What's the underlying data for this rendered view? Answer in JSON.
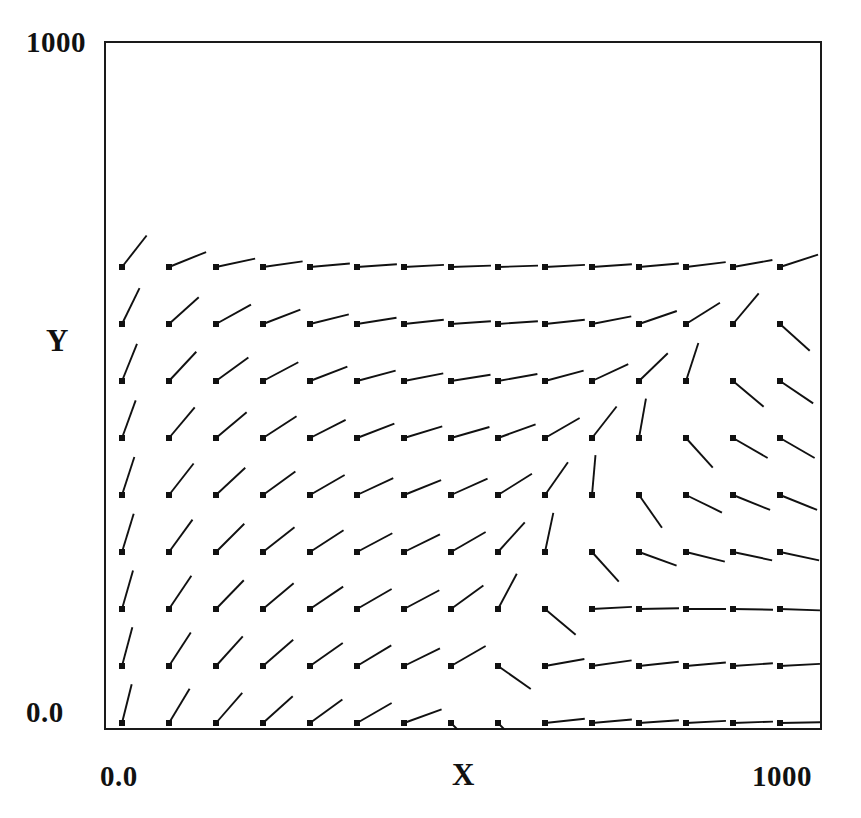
{
  "figure": {
    "kind": "vector-field-plot",
    "background_color": "#ffffff",
    "frame_color": "#1a1a1a",
    "vector_color": "#111111",
    "marker_color": "#111111"
  },
  "axes": {
    "x": {
      "title": "X",
      "tick_labels": [
        "0.0",
        "1000"
      ],
      "range": [
        0,
        1000
      ]
    },
    "y": {
      "title": "Y",
      "tick_labels": [
        "0.0",
        "1000"
      ],
      "range": [
        0,
        1000
      ]
    }
  },
  "chart_data": {
    "type": "scatter",
    "subtype": "quiver",
    "title": "",
    "xlabel": "X",
    "ylabel": "Y",
    "xlim": [
      0,
      1000
    ],
    "ylim": [
      0,
      1000
    ],
    "xticks": [
      0,
      1000
    ],
    "xticklabels": [
      "0.0",
      "1000"
    ],
    "yticks": [
      0,
      1000
    ],
    "yticklabels": [
      "0.0",
      "1000"
    ],
    "grid": false,
    "legend": null,
    "grid_shape": {
      "columns": 16,
      "rows": 14
    },
    "marker": "filled-square",
    "marker_size_px": 6,
    "vector_length_px": 40,
    "annotations": [
      {
        "label": "saddle/convergence point",
        "x": 660,
        "y": 660
      },
      {
        "label": "source point",
        "x": 862,
        "y": 295
      }
    ],
    "x_grid": [
      18,
      65,
      112,
      159,
      206,
      253,
      300,
      347,
      394,
      441,
      488,
      535,
      582,
      629,
      676,
      723
    ],
    "y_grid": [
      967,
      910,
      853,
      796,
      739,
      682,
      625,
      568,
      511,
      454,
      397,
      340,
      283,
      226
    ],
    "vectors": [
      {
        "row": 0,
        "angles_deg": [
          50,
          -23,
          -47,
          -58,
          -64,
          -70,
          -77,
          -84,
          -86,
          -82,
          -76,
          -68,
          -60,
          -52,
          -47,
          -40
        ]
      },
      {
        "row": 1,
        "angles_deg": [
          80,
          47,
          7,
          -8,
          -38,
          -54,
          -62,
          -66,
          -66,
          -62,
          -55,
          -47,
          -40,
          -34,
          -30,
          -27
        ]
      },
      {
        "row": 2,
        "angles_deg": [
          80,
          62,
          38,
          25,
          8,
          -12,
          -30,
          -45,
          -50,
          -48,
          -42,
          -36,
          -31,
          -27,
          -24,
          -21
        ]
      },
      {
        "row": 3,
        "angles_deg": [
          78,
          62,
          48,
          38,
          28,
          14,
          -5,
          -32,
          -50,
          -44,
          -34,
          -28,
          -24,
          -21,
          -19,
          -17
        ]
      },
      {
        "row": 4,
        "angles_deg": [
          77,
          60,
          50,
          42,
          34,
          26,
          12,
          -18,
          -62,
          -40,
          -26,
          -20,
          -17,
          -15,
          -14,
          -13
        ]
      },
      {
        "row": 5,
        "angles_deg": [
          76,
          59,
          49,
          42,
          36,
          30,
          20,
          -45,
          -45,
          6,
          5,
          4,
          3,
          2,
          1,
          0
        ]
      },
      {
        "row": 6,
        "angles_deg": [
          75,
          57,
          48,
          41,
          35,
          31,
          26,
          30,
          -35,
          10,
          8,
          6,
          5,
          4,
          3,
          2
        ]
      },
      {
        "row": 7,
        "angles_deg": [
          74,
          56,
          46,
          40,
          34,
          30,
          28,
          36,
          62,
          -40,
          3,
          1,
          0,
          -1,
          -2,
          -3
        ]
      },
      {
        "row": 8,
        "angles_deg": [
          73,
          54,
          45,
          38,
          33,
          28,
          26,
          30,
          48,
          78,
          -48,
          -20,
          -14,
          -12,
          -12,
          -13
        ]
      },
      {
        "row": 9,
        "angles_deg": [
          72,
          52,
          43,
          36,
          30,
          25,
          22,
          24,
          32,
          55,
          85,
          -55,
          -26,
          -22,
          -22,
          -24
        ]
      },
      {
        "row": 10,
        "angles_deg": [
          70,
          50,
          40,
          33,
          27,
          21,
          17,
          16,
          20,
          30,
          52,
          80,
          -48,
          -30,
          -30,
          -33
        ]
      },
      {
        "row": 11,
        "angles_deg": [
          68,
          47,
          36,
          28,
          21,
          15,
          11,
          9,
          10,
          15,
          25,
          44,
          72,
          -40,
          -34,
          -38
        ]
      },
      {
        "row": 12,
        "angles_deg": [
          64,
          42,
          29,
          21,
          14,
          9,
          6,
          4,
          4,
          6,
          11,
          19,
          32,
          50,
          -42,
          -46
        ]
      },
      {
        "row": 13,
        "angles_deg": [
          52,
          22,
          12,
          8,
          5,
          4,
          3,
          2,
          2,
          3,
          4,
          5,
          7,
          10,
          18,
          48
        ]
      }
    ]
  }
}
